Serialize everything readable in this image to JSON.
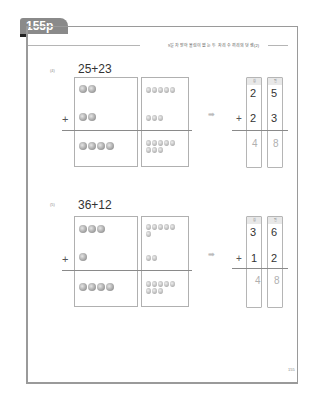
{
  "page_tab": "155p",
  "header": "9일차 받아올림이 없는 두 자리 수끼리의 덧셈(2)",
  "page_number": "155",
  "problems": [
    {
      "number": "(4)",
      "expression": "25+23",
      "top_tens": 2,
      "top_ones": 5,
      "bottom_tens": 2,
      "bottom_ones": 3,
      "result_tens": 4,
      "result_ones": 8,
      "column_headers": [
        "십",
        "일"
      ],
      "vertical": {
        "a_tens": "2",
        "a_ones": "5",
        "b_tens": "2",
        "b_ones": "3",
        "sum_tens": "4",
        "sum_ones": "8"
      }
    },
    {
      "number": "(5)",
      "expression": "36+12",
      "top_tens": 3,
      "top_ones": 6,
      "bottom_tens": 1,
      "bottom_ones": 2,
      "result_tens": 4,
      "result_ones": 8,
      "column_headers": [
        "십",
        "일"
      ],
      "vertical": {
        "a_tens": "3",
        "a_ones": "6",
        "b_tens": "1",
        "b_ones": "2",
        "sum_tens": "4",
        "sum_ones": "8"
      }
    }
  ],
  "symbols": {
    "plus": "+",
    "arrow": "➡"
  }
}
